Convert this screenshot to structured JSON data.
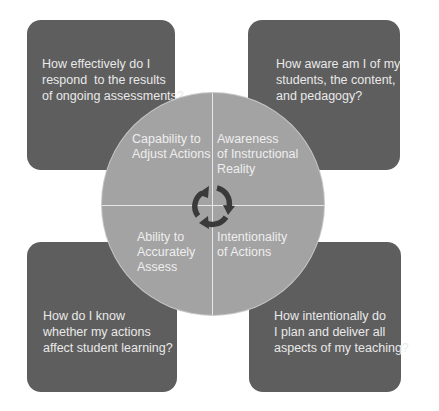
{
  "diagram": {
    "type": "reflective-practice-cycle",
    "colors": {
      "box_fill": "#5e5e5e",
      "circle_fill": "#a3a3a3",
      "text": "#e9e9e9",
      "divider": "#e6e6e6",
      "arrow": "#3a3a3a"
    },
    "questions": {
      "top_left": "How effectively do I\nrespond  to the results\nof ongoing assessments?",
      "top_right": "How aware am I of my\nstudents, the content,\nand pedagogy?",
      "bottom_left": "How do I know\nwhether my actions\naffect student learning?",
      "bottom_right": "How intentionally do\nI plan and deliver all\naspects of my teaching?"
    },
    "quadrants": {
      "top_left": "Capability to\nAdjust Actions",
      "top_right": "Awareness\nof Instructional\nReality",
      "bottom_left": "Ability to\nAccurately\nAssess",
      "bottom_right": "Intentionality\nof Actions"
    },
    "center_icon": "cycle-arrows-icon"
  }
}
